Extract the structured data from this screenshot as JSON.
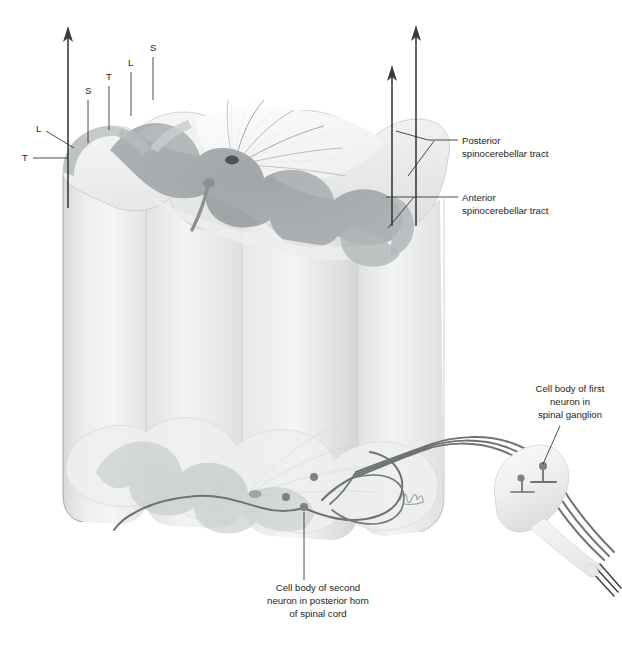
{
  "figure": {
    "background_color": "#ffffff",
    "ink_color": "#231f20"
  },
  "palette": {
    "gray_matter": "#a9abad",
    "gray_matter_dark": "#9b9ea0",
    "white_matter": "#e9eaea",
    "white_matter_light": "#f4f4f4",
    "cylinder_body": "#e3e5e5",
    "cylinder_body_light": "#eff0f0",
    "outline": "#9aa0a2",
    "neuron_stroke": "#6f7274",
    "arrow": "#3b3b3d",
    "text": "#231f20",
    "ganglion_fill": "#f2f3f3"
  },
  "somatotopy_labels": [
    {
      "id": "label-left-T",
      "text": "T",
      "x": 22,
      "y": 161,
      "leader": "M 33 158 L 68 158"
    },
    {
      "id": "label-left-L",
      "text": "L",
      "x": 36,
      "y": 132,
      "leader": "M 46 131 L 72 146"
    },
    {
      "id": "label-top-S1",
      "text": "S",
      "x": 85,
      "y": 94,
      "leader": "M 88 99 L 88 143"
    },
    {
      "id": "label-top-T",
      "text": "T",
      "x": 106,
      "y": 80,
      "leader": "M 109 85 L 109 128"
    },
    {
      "id": "label-top-L",
      "text": "L",
      "x": 128,
      "y": 66,
      "leader": "M 131 71 L 131 114"
    },
    {
      "id": "label-top-S2",
      "text": "S",
      "x": 150,
      "y": 51,
      "leader": "M 153 56 L 153 98"
    }
  ],
  "tract_labels": [
    {
      "id": "posterior-spinocerebellar-tract",
      "line1": "Posterior",
      "line2": "spinocerebellar tract",
      "text_x": 462,
      "line1_y": 144,
      "line2_y": 157,
      "leaders": [
        "M 458 140 L 425 140 L 395 131",
        "M 436 140 L 410 175"
      ]
    },
    {
      "id": "anterior-spinocerebellar-tract",
      "line1": "Anterior",
      "line2": "spinocerebellar tract",
      "text_x": 462,
      "line1_y": 201,
      "line2_y": 214,
      "leaders": [
        "M 458 197 L 385 197",
        "M 416 197 L 390 227"
      ]
    }
  ],
  "neuron_labels": [
    {
      "id": "first-neuron-label",
      "lines": [
        "Cell body of first",
        "neuron in",
        "spinal ganglion"
      ],
      "center_x": 570,
      "line_ys": [
        392,
        405,
        418
      ],
      "leader": "M 560 426 L 543 466"
    },
    {
      "id": "second-neuron-label",
      "lines": [
        "Cell body of second",
        "neuron in posterior horn",
        "of spinal cord"
      ],
      "center_x": 318,
      "line_ys": [
        591,
        604,
        617
      ],
      "leader": "M 304 580 L 304 508"
    }
  ],
  "arrows": [
    {
      "id": "ascending-arrow-left",
      "x": 68,
      "y_top": 28,
      "y_bottom": 208
    },
    {
      "id": "ascending-arrow-middle",
      "x": 392,
      "y_top": 66,
      "y_bottom": 224
    },
    {
      "id": "ascending-arrow-right",
      "x": 416,
      "y_top": 26,
      "y_bottom": 224
    }
  ],
  "artist_signature": {
    "id": "artist-signature",
    "x": 404,
    "y": 498
  },
  "anatomy_regions": [
    {
      "name": "posterior-funiculus",
      "description": "fan-shaped fibers radiating from central canal"
    },
    {
      "name": "gray-matter-butterfly",
      "description": "H-shaped gray matter with anterior and posterior horns"
    },
    {
      "name": "central-canal",
      "description": "small dark opening at center of gray commissure"
    },
    {
      "name": "spinal-ganglion",
      "description": "fusiform swelling on dorsal root containing first-order neurons"
    },
    {
      "name": "dorsal-root-fibers",
      "description": "three parallel afferent fibers entering the cord"
    },
    {
      "name": "lower-cross-section",
      "description": "faded second transverse section at base of cord segment"
    }
  ]
}
